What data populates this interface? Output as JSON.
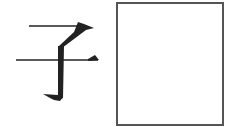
{
  "character": {
    "text": "子",
    "color": "#222222"
  },
  "answer_box": {
    "value": "",
    "border_color": "#555555"
  }
}
